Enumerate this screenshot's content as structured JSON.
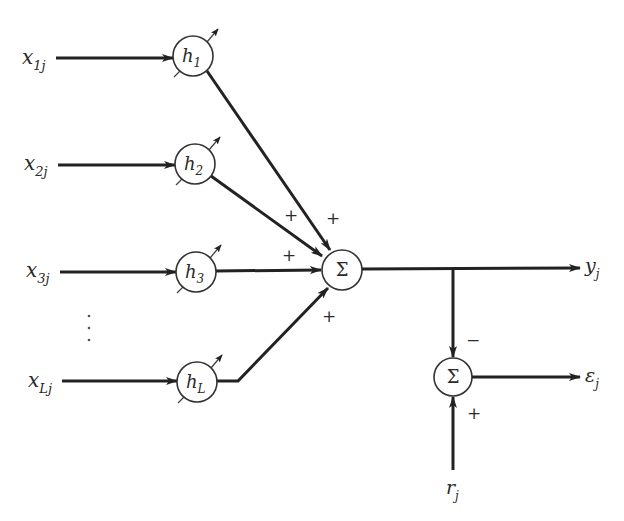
{
  "diagram": {
    "inputs": [
      {
        "base": "x",
        "sub": "1j",
        "y": 58
      },
      {
        "base": "x",
        "sub": "2j",
        "y": 164
      },
      {
        "base": "x",
        "sub": "3j",
        "y": 271
      },
      {
        "base": "x",
        "sub": "Lj",
        "y": 381
      }
    ],
    "ellipsis": "⋮",
    "weights": [
      {
        "base": "h",
        "sub": "1",
        "cx": 193,
        "cy": 56
      },
      {
        "base": "h",
        "sub": "2",
        "cx": 195,
        "cy": 164
      },
      {
        "base": "h",
        "sub": "3",
        "cx": 196,
        "cy": 272
      },
      {
        "base": "h",
        "sub": "L",
        "cx": 197,
        "cy": 382
      }
    ],
    "summer_main": {
      "symbol": "Σ",
      "signs": [
        "+",
        "+",
        "+",
        "+"
      ]
    },
    "summer_error": {
      "symbol": "Σ",
      "sign_top": "−",
      "sign_bottom": "+"
    },
    "outputs": {
      "y": {
        "base": "y",
        "sub": "j"
      },
      "error": {
        "base": "ε",
        "sub": "j"
      },
      "reference": {
        "base": "r",
        "sub": "j"
      }
    }
  }
}
